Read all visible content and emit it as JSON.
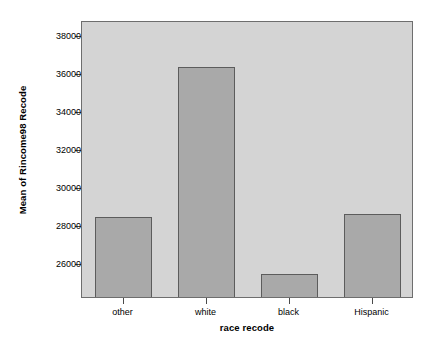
{
  "chart_data": {
    "type": "bar",
    "title": "",
    "subtitle": "",
    "xlabel": "race recode",
    "ylabel": "Mean of Rincome98 Recode",
    "categories": [
      "other",
      "white",
      "black",
      "Hispanic"
    ],
    "values": [
      28400,
      36300,
      25400,
      28550
    ],
    "series": [
      {
        "name": "Mean of Rincome98 Recode",
        "values": [
          28400,
          36300,
          25400,
          28550
        ]
      }
    ],
    "ylim": [
      24200,
      38800
    ],
    "yticks": [
      26000,
      28000,
      30000,
      32000,
      34000,
      36000,
      38000
    ],
    "ytick_labels": [
      "26000",
      "28000",
      "30000",
      "32000",
      "34000",
      "36000",
      "38000"
    ],
    "xtick_labels": [
      "other",
      "white",
      "black",
      "Hispanic"
    ],
    "grid": false,
    "legend": false,
    "legend_position": "none",
    "colors": {
      "plot_background": "#d4d4d4",
      "bar_fill": "#a9a9a9",
      "bar_border": "#5c5c5c",
      "frame": "#6e6e6e",
      "text": "#000000",
      "page_background": "#ffffff"
    }
  }
}
